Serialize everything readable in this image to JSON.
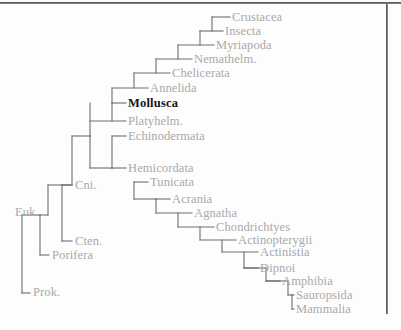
{
  "figure": {
    "type": "cladogram",
    "title": "",
    "line_color": "#6e6e6e",
    "label_color": "#a9a9a9",
    "highlight_color": "#151515",
    "background": "#fdfdfd",
    "frame_color": "#4a4a4a",
    "highlight_taxon": "Mollusca"
  },
  "taxa": [
    {
      "label": "Crustacea",
      "x": 232,
      "y": 17,
      "highlight": false
    },
    {
      "label": "Insecta",
      "x": 225,
      "y": 31,
      "highlight": false
    },
    {
      "label": "Myriapoda",
      "x": 216,
      "y": 45,
      "highlight": false
    },
    {
      "label": "Nemathelm.",
      "x": 194,
      "y": 59,
      "highlight": false
    },
    {
      "label": "Chelicerata",
      "x": 172,
      "y": 73,
      "highlight": false
    },
    {
      "label": "Annelida",
      "x": 150,
      "y": 88,
      "highlight": false
    },
    {
      "label": "Mollusca",
      "x": 128,
      "y": 103,
      "highlight": true
    },
    {
      "label": "Platyhelm.",
      "x": 128,
      "y": 121,
      "highlight": false
    },
    {
      "label": "Echinodermata",
      "x": 128,
      "y": 136,
      "highlight": false
    },
    {
      "label": "Hemicordata",
      "x": 128,
      "y": 168,
      "highlight": false
    },
    {
      "label": "Tunicata",
      "x": 150,
      "y": 182,
      "highlight": false
    },
    {
      "label": "Acrania",
      "x": 172,
      "y": 199,
      "highlight": false
    },
    {
      "label": "Agnatha",
      "x": 194,
      "y": 213,
      "highlight": false
    },
    {
      "label": "Chondrichtyes",
      "x": 216,
      "y": 227,
      "highlight": false
    },
    {
      "label": "Actinopterygii",
      "x": 238,
      "y": 240,
      "highlight": false
    },
    {
      "label": "Actinistia",
      "x": 260,
      "y": 252,
      "highlight": false
    },
    {
      "label": "Dipnoi",
      "x": 260,
      "y": 268,
      "highlight": false
    },
    {
      "label": "Amphibia",
      "x": 282,
      "y": 281,
      "highlight": false
    },
    {
      "label": "Sauropsida",
      "x": 296,
      "y": 295,
      "highlight": false
    },
    {
      "label": "Mammalia",
      "x": 296,
      "y": 309,
      "highlight": false
    },
    {
      "label": "Cni.",
      "x": 75,
      "y": 185,
      "highlight": false
    },
    {
      "label": "Cten.",
      "x": 75,
      "y": 241,
      "highlight": false
    },
    {
      "label": "Porifera",
      "x": 52,
      "y": 255,
      "highlight": false
    },
    {
      "label": "Euk.",
      "x": 15,
      "y": 212,
      "highlight": false
    },
    {
      "label": "Prok.",
      "x": 33,
      "y": 292,
      "highlight": false
    }
  ],
  "branches": {
    "description": "Nested ladder cladogram branch segments",
    "segments": [
      {
        "name": "root-stem",
        "x1": 22,
        "y1": 293,
        "x2": 22,
        "y2": 215
      },
      {
        "name": "root-to-prok",
        "x1": 22,
        "y1": 293,
        "x2": 30,
        "y2": 293
      },
      {
        "name": "root-to-euk",
        "x1": 22,
        "y1": 215,
        "x2": 40,
        "y2": 215
      },
      {
        "name": "euk-vertical",
        "x1": 40,
        "y1": 215,
        "x2": 40,
        "y2": 255
      },
      {
        "name": "euk-to-porifera",
        "x1": 40,
        "y1": 255,
        "x2": 49,
        "y2": 255
      },
      {
        "name": "euk-to-metazoa",
        "x1": 40,
        "y1": 215,
        "x2": 48,
        "y2": 215
      },
      {
        "name": "metazoa-vert",
        "x1": 48,
        "y1": 185,
        "x2": 48,
        "y2": 215
      },
      {
        "name": "cten-vert",
        "x1": 62,
        "y1": 185,
        "x2": 62,
        "y2": 241
      },
      {
        "name": "cten-tip",
        "x1": 62,
        "y1": 241,
        "x2": 72,
        "y2": 241
      },
      {
        "name": "cni-tip",
        "x1": 62,
        "y1": 185,
        "x2": 72,
        "y2": 185
      },
      {
        "name": "metazoa-cross",
        "x1": 48,
        "y1": 185,
        "x2": 72,
        "y2": 185
      },
      {
        "name": "bilateria-vert",
        "x1": 72,
        "y1": 136,
        "x2": 72,
        "y2": 185
      },
      {
        "name": "proto-deut-top",
        "x1": 72,
        "y1": 136,
        "x2": 90,
        "y2": 136
      },
      {
        "name": "proto-vert",
        "x1": 90,
        "y1": 103,
        "x2": 90,
        "y2": 136
      },
      {
        "name": "platy-tip",
        "x1": 90,
        "y1": 121,
        "x2": 126,
        "y2": 121
      },
      {
        "name": "platy-stub",
        "x1": 112,
        "y1": 103,
        "x2": 112,
        "y2": 121
      },
      {
        "name": "mollusca-tip",
        "x1": 112,
        "y1": 103,
        "x2": 126,
        "y2": 103
      },
      {
        "name": "annelid-vert",
        "x1": 112,
        "y1": 88,
        "x2": 112,
        "y2": 103
      },
      {
        "name": "annelid-tip",
        "x1": 112,
        "y1": 88,
        "x2": 148,
        "y2": 88
      },
      {
        "name": "arth-vert",
        "x1": 134,
        "y1": 73,
        "x2": 134,
        "y2": 88
      },
      {
        "name": "chelic-tip",
        "x1": 134,
        "y1": 73,
        "x2": 170,
        "y2": 73
      },
      {
        "name": "nemat-vert",
        "x1": 156,
        "y1": 59,
        "x2": 156,
        "y2": 73
      },
      {
        "name": "nemat-tip",
        "x1": 156,
        "y1": 59,
        "x2": 192,
        "y2": 59
      },
      {
        "name": "myria-vert",
        "x1": 178,
        "y1": 45,
        "x2": 178,
        "y2": 59
      },
      {
        "name": "myria-tip",
        "x1": 178,
        "y1": 45,
        "x2": 214,
        "y2": 45
      },
      {
        "name": "insect-vert",
        "x1": 200,
        "y1": 31,
        "x2": 200,
        "y2": 45
      },
      {
        "name": "insect-tip",
        "x1": 200,
        "y1": 31,
        "x2": 223,
        "y2": 31
      },
      {
        "name": "crust-vert",
        "x1": 212,
        "y1": 17,
        "x2": 212,
        "y2": 31
      },
      {
        "name": "crust-tip",
        "x1": 212,
        "y1": 17,
        "x2": 230,
        "y2": 17
      },
      {
        "name": "deut-vert",
        "x1": 90,
        "y1": 136,
        "x2": 90,
        "y2": 168
      },
      {
        "name": "echino-tip",
        "x1": 112,
        "y1": 136,
        "x2": 126,
        "y2": 136
      },
      {
        "name": "echino-stub",
        "x1": 112,
        "y1": 136,
        "x2": 112,
        "y2": 152
      },
      {
        "name": "deut-cross",
        "x1": 90,
        "y1": 168,
        "x2": 112,
        "y2": 168
      },
      {
        "name": "hemi-vert",
        "x1": 112,
        "y1": 152,
        "x2": 112,
        "y2": 168
      },
      {
        "name": "hemi-tip",
        "x1": 112,
        "y1": 168,
        "x2": 126,
        "y2": 168
      },
      {
        "name": "chordata-vert",
        "x1": 134,
        "y1": 182,
        "x2": 134,
        "y2": 199
      },
      {
        "name": "tunicata-tip",
        "x1": 134,
        "y1": 182,
        "x2": 148,
        "y2": 182
      },
      {
        "name": "chordata-cross",
        "x1": 134,
        "y1": 199,
        "x2": 156,
        "y2": 199
      },
      {
        "name": "acrania-vert",
        "x1": 156,
        "y1": 199,
        "x2": 156,
        "y2": 213
      },
      {
        "name": "acrania-tip",
        "x1": 156,
        "y1": 199,
        "x2": 170,
        "y2": 199
      },
      {
        "name": "agnatha-vert",
        "x1": 178,
        "y1": 213,
        "x2": 178,
        "y2": 227
      },
      {
        "name": "agnatha-tip",
        "x1": 156,
        "y1": 213,
        "x2": 192,
        "y2": 213
      },
      {
        "name": "chondr-tip",
        "x1": 178,
        "y1": 227,
        "x2": 214,
        "y2": 227
      },
      {
        "name": "osteich-vert",
        "x1": 200,
        "y1": 227,
        "x2": 200,
        "y2": 240
      },
      {
        "name": "actinop-tip",
        "x1": 200,
        "y1": 240,
        "x2": 236,
        "y2": 240
      },
      {
        "name": "sarco-vert",
        "x1": 222,
        "y1": 240,
        "x2": 222,
        "y2": 252
      },
      {
        "name": "actinistia-tip",
        "x1": 222,
        "y1": 252,
        "x2": 258,
        "y2": 252
      },
      {
        "name": "dipnoi-vert",
        "x1": 244,
        "y1": 252,
        "x2": 244,
        "y2": 268
      },
      {
        "name": "dipnoi-tip",
        "x1": 244,
        "y1": 268,
        "x2": 258,
        "y2": 268
      },
      {
        "name": "tetrapod-cross",
        "x1": 244,
        "y1": 268,
        "x2": 266,
        "y2": 268
      },
      {
        "name": "tetrapod-vert",
        "x1": 266,
        "y1": 268,
        "x2": 266,
        "y2": 281
      },
      {
        "name": "amphibia-tip",
        "x1": 266,
        "y1": 281,
        "x2": 280,
        "y2": 281
      },
      {
        "name": "amniota-cross",
        "x1": 266,
        "y1": 281,
        "x2": 288,
        "y2": 281
      },
      {
        "name": "amniota-vert",
        "x1": 288,
        "y1": 281,
        "x2": 288,
        "y2": 295
      },
      {
        "name": "amniota-stem",
        "x1": 288,
        "y1": 295,
        "x2": 292,
        "y2": 295
      },
      {
        "name": "mammal-vert",
        "x1": 292,
        "y1": 295,
        "x2": 292,
        "y2": 309
      },
      {
        "name": "sauropsida-tip",
        "x1": 292,
        "y1": 295,
        "x2": 294,
        "y2": 295
      },
      {
        "name": "mammalia-tip",
        "x1": 292,
        "y1": 309,
        "x2": 294,
        "y2": 309
      }
    ]
  }
}
